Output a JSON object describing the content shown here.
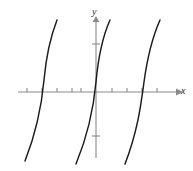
{
  "figure": {
    "background_color": "#ffffff",
    "axis_color": "#8a8a8a",
    "curve_color": "#1a1a1a"
  },
  "axes": {
    "x_axis_label": "x",
    "y_axis_label": "y",
    "origin": {
      "x": 96,
      "y": 92
    },
    "x_axis": {
      "start_x": 18,
      "end_x": 178,
      "y": 92,
      "has_arrow": true,
      "arrow_direction": "right",
      "tick_half_length": 4,
      "tick_positions_px": [
        27,
        42,
        57,
        72,
        81,
        112,
        127,
        142,
        157
      ],
      "tick_labels": []
    },
    "y_axis": {
      "x": 96,
      "top_y": 18,
      "bottom_y": 158,
      "has_arrow": true,
      "arrow_direction": "up",
      "tick_half_length": 4,
      "tick_positions_px": [
        44,
        136
      ],
      "tick_labels": []
    }
  },
  "chart_data": {
    "type": "line",
    "title": "",
    "xlabel": "x",
    "ylabel": "y",
    "grid": false,
    "legend": null,
    "axis_ticks_labeled": false,
    "series": [
      {
        "name": "branch-left",
        "x_intercept_px": 44,
        "top_endpoint_px": {
          "x": 57,
          "y": 20
        },
        "bottom_endpoint_px": {
          "x": 25,
          "y": 161
        },
        "path": "M 57,20 C 50,38 46,58 44,80 C 42,102 38,128 25,161"
      },
      {
        "name": "branch-middle",
        "x_intercept_px": 96,
        "top_endpoint_px": {
          "x": 110,
          "y": 20
        },
        "bottom_endpoint_px": {
          "x": 76,
          "y": 164
        },
        "path": "M 110,20 C 102,38 98,60 96,82 C 94,104 90,130 76,164"
      },
      {
        "name": "branch-right",
        "x_intercept_px": 144,
        "top_endpoint_px": {
          "x": 160,
          "y": 20
        },
        "bottom_endpoint_px": {
          "x": 125,
          "y": 164
        },
        "path": "M 160,20 C 152,38 147,60 144,82 C 141,104 138,130 125,164"
      }
    ],
    "period_px": 50,
    "shape": "tangent-like increasing branches"
  }
}
